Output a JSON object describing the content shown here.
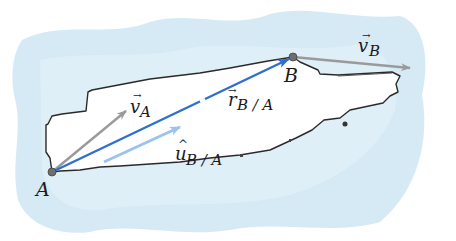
{
  "diagram": {
    "points": {
      "A": {
        "label": "A",
        "x": 52,
        "y": 172
      },
      "B": {
        "label": "B",
        "x": 293,
        "y": 57
      }
    },
    "vectors": {
      "v_A": {
        "label_main": "v",
        "label_sub": "A",
        "accent": "→",
        "color": "#9a9a9a"
      },
      "v_B": {
        "label_main": "v",
        "label_sub": "B",
        "accent": "→",
        "color": "#9a9a9a"
      },
      "r_BA": {
        "label_main": "r",
        "label_sub": "B / A",
        "accent": "→",
        "color": "#2f6fcf"
      },
      "u_BA": {
        "label_main": "u",
        "label_sub": "B / A",
        "accent": "^",
        "color": "#9cc3ee"
      }
    },
    "colors": {
      "water": "#cfe6f3",
      "hull_fill": "#ffffff",
      "hull_outline": "#2a2a2a",
      "point": "#6e6e6e"
    }
  }
}
